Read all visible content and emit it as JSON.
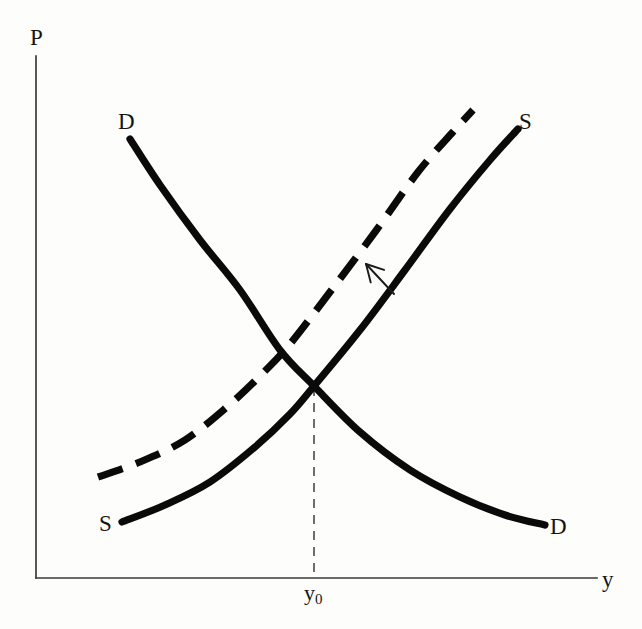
{
  "figure": {
    "type": "economics-supply-demand-diagram",
    "background_color": "#fdfdfc",
    "ink_color": "#0a0a0a",
    "axis_color": "#3a3a3a"
  },
  "axes": {
    "y_axis_label": "P",
    "x_axis_label": "y",
    "origin": {
      "x": 36,
      "y": 578
    },
    "y_axis_top": {
      "x": 36,
      "y": 56
    },
    "x_axis_right": {
      "x": 597,
      "y": 578
    }
  },
  "ticks": [
    {
      "name": "equilibrium-quantity",
      "label_main": "y",
      "label_sub": "0",
      "x": 314,
      "y": 596
    }
  ],
  "curve_labels": [
    {
      "name": "demand-top-label",
      "text": "D",
      "x": 118,
      "y": 110
    },
    {
      "name": "supply-top-label",
      "text": "S",
      "x": 519,
      "y": 110
    },
    {
      "name": "supply-bottom-label",
      "text": "S",
      "x": 99,
      "y": 512
    },
    {
      "name": "demand-bottom-label",
      "text": "D",
      "x": 550,
      "y": 515
    }
  ],
  "annotations": [
    {
      "name": "shift-arrow",
      "meaning": "supply curve shifts left/up",
      "tip": {
        "x": 366,
        "y": 264
      },
      "tail": {
        "x": 394,
        "y": 294
      }
    },
    {
      "name": "equilibrium-guide-line",
      "meaning": "dashed vertical drop from equilibrium to y-axis tick",
      "from": {
        "x": 314,
        "y": 387
      },
      "to": {
        "x": 314,
        "y": 578
      }
    }
  ],
  "chart_data": {
    "type": "line",
    "title": "",
    "xlabel": "y",
    "ylabel": "P",
    "grid": false,
    "legend": "inline-curve-endpoint-labels",
    "xlim": [
      36,
      597
    ],
    "ylim": [
      578,
      56
    ],
    "note": "Coordinates are in screen pixels; y grows downward. P is price (vertical), y is output/quantity (horizontal).",
    "equilibrium": {
      "name": "initial-equilibrium",
      "x": 314,
      "y": 386,
      "x_tick_label": "y0"
    },
    "series": [
      {
        "name": "Demand curve D",
        "style": "solid",
        "label_start": "D",
        "label_end": "D",
        "points": [
          [
            130,
            139
          ],
          [
            160,
            185
          ],
          [
            200,
            240
          ],
          [
            240,
            290
          ],
          [
            280,
            350
          ],
          [
            314,
            386
          ],
          [
            360,
            432
          ],
          [
            410,
            470
          ],
          [
            460,
            497
          ],
          [
            505,
            515
          ],
          [
            545,
            525
          ]
        ]
      },
      {
        "name": "Supply curve S (original)",
        "style": "solid",
        "label_start": "S",
        "label_end": "S",
        "points": [
          [
            122,
            522
          ],
          [
            165,
            505
          ],
          [
            210,
            482
          ],
          [
            255,
            447
          ],
          [
            290,
            414
          ],
          [
            314,
            386
          ],
          [
            360,
            330
          ],
          [
            405,
            270
          ],
          [
            450,
            209
          ],
          [
            490,
            160
          ],
          [
            518,
            129
          ]
        ]
      },
      {
        "name": "Supply curve S (shifted, dashed)",
        "style": "dashed",
        "label_start": "",
        "label_end": "",
        "points": [
          [
            98,
            477
          ],
          [
            140,
            462
          ],
          [
            185,
            440
          ],
          [
            228,
            406
          ],
          [
            262,
            374
          ],
          [
            290,
            344
          ],
          [
            330,
            292
          ],
          [
            375,
            232
          ],
          [
            418,
            172
          ],
          [
            452,
            133
          ],
          [
            473,
            110
          ]
        ]
      }
    ]
  }
}
